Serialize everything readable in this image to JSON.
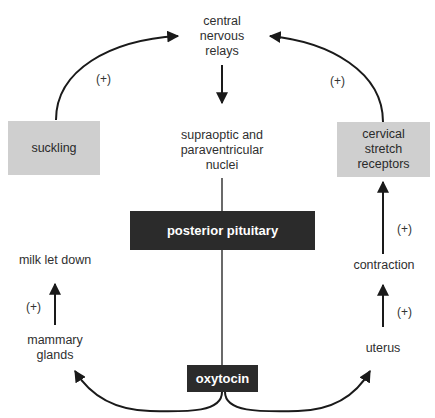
{
  "diagram": {
    "nodes": {
      "central": "central\nnervous\nrelays",
      "nuclei": "supraoptic and\nparaventricular\nnuclei",
      "suckling": "suckling",
      "cervical": "cervical\nstretch\nreceptors",
      "posterior_pituitary": "posterior pituitary",
      "milk_let_down": "milk let down",
      "mammary": "mammary\nglands",
      "contraction": "contraction",
      "uterus": "uterus",
      "oxytocin": "oxytocin"
    },
    "labels": {
      "plus_left_arc": "(+)",
      "plus_right_arc": "(+)",
      "plus_milk": "(+)",
      "plus_cervical": "(+)",
      "plus_uterus": "(+)"
    },
    "edges": [
      {
        "from": "suckling",
        "to": "central",
        "sign": "(+)"
      },
      {
        "from": "cervical",
        "to": "central",
        "sign": "(+)"
      },
      {
        "from": "central",
        "to": "nuclei"
      },
      {
        "from": "nuclei",
        "to": "posterior_pituitary"
      },
      {
        "from": "posterior_pituitary",
        "to": "oxytocin"
      },
      {
        "from": "oxytocin",
        "to": "mammary"
      },
      {
        "from": "oxytocin",
        "to": "uterus"
      },
      {
        "from": "mammary",
        "to": "milk_let_down",
        "sign": "(+)"
      },
      {
        "from": "uterus",
        "to": "contraction",
        "sign": "(+)"
      },
      {
        "from": "contraction",
        "to": "cervical",
        "sign": "(+)"
      }
    ],
    "colors": {
      "gray_box": "#cfcfcf",
      "dark_box": "#2b2b2b",
      "line": "#1a1a1a"
    }
  }
}
